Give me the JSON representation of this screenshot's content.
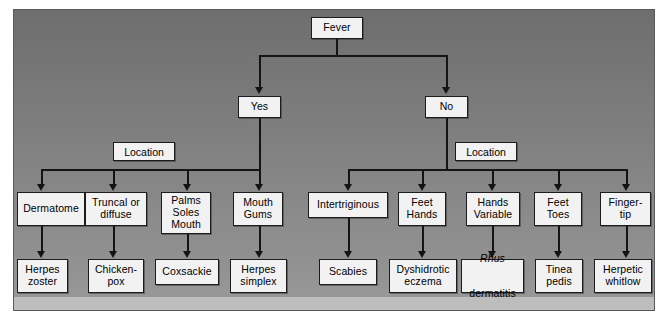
{
  "figure": {
    "kind": "clinical-decision-flowchart",
    "root": {
      "label": "Fever"
    },
    "branch_labels": {
      "yes": "Yes",
      "no": "No"
    },
    "location_label_left": "Location",
    "location_label_right": "Location",
    "left_branch": {
      "categories": [
        "Dermatome",
        "Truncal or\ndiffuse",
        "Palms\nSoles\nMouth",
        "Mouth\nGums"
      ],
      "diagnoses": [
        "Herpes\nzoster",
        "Chicken-\npox",
        "Coxsackie",
        "Herpes\nsimplex"
      ]
    },
    "right_branch": {
      "categories": [
        "Intertriginous",
        "Feet\nHands",
        "Hands\nVariable",
        "Feet\nToes",
        "Finger-\ntip"
      ],
      "diagnoses": [
        "Scabies",
        "Dyshidrotic\neczema",
        {
          "italic": "Rhus",
          "rest": "dermatitis"
        },
        "Tinea\npedis",
        "Herpetic\nwhitlow"
      ]
    },
    "colors": {
      "panel_top": "#6e6e6e",
      "panel_bottom": "#9a9a9a",
      "node_fill": "#f2f2f2",
      "line": "#141414",
      "page": "#ffffff"
    }
  }
}
